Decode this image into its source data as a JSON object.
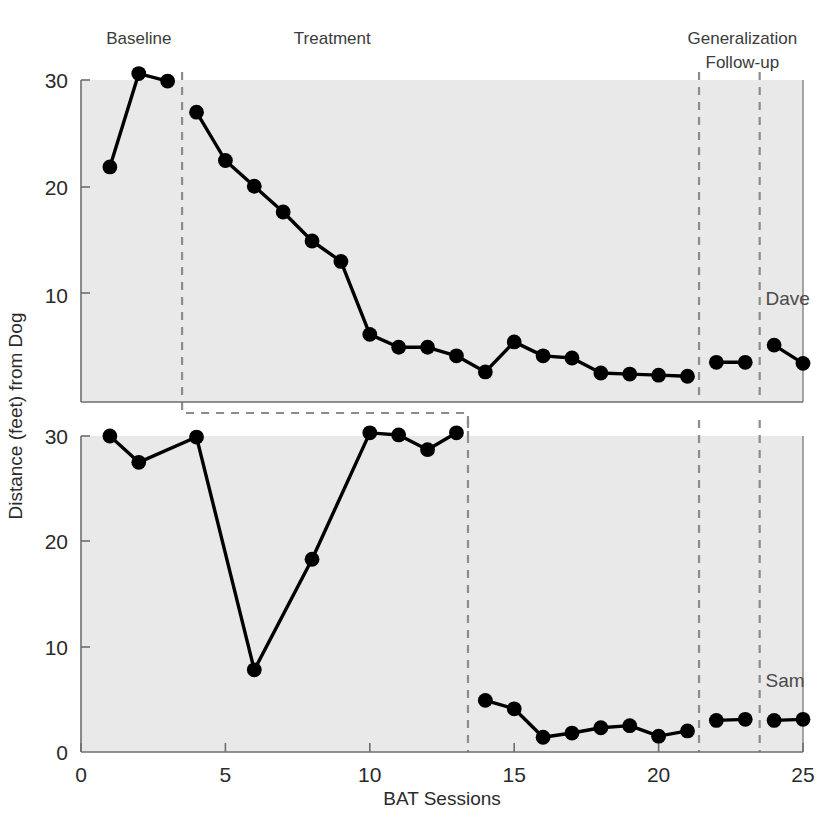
{
  "chart_data": {
    "type": "line",
    "title": "",
    "xlabel": "BAT Sessions",
    "ylabel": "Distance (feet) from Dog",
    "xlim": [
      0,
      25
    ],
    "ylim_top": [
      0,
      31
    ],
    "ylim_bottom": [
      0,
      31
    ],
    "grid": false,
    "legend": "none",
    "xticks": [
      0,
      5,
      10,
      15,
      20,
      25
    ],
    "yticks_top": [
      10,
      20,
      30
    ],
    "yticks_bottom": [
      0,
      10,
      20,
      30
    ],
    "phase_labels": [
      {
        "text": "Baseline",
        "x_session": 2.0,
        "panel": "top"
      },
      {
        "text": "Treatment",
        "x_session": 8.7,
        "panel": "top"
      },
      {
        "text": "Generalization",
        "x_session": 22.9,
        "panel": "top"
      },
      {
        "text": "Follow-up",
        "x_session": 22.9,
        "panel": "top"
      }
    ],
    "phase_dividers_top": [
      3.5,
      21.4,
      23.5
    ],
    "phase_dividers_bottom": [
      13.4,
      21.4,
      23.5
    ],
    "series": [
      {
        "name": "Dave",
        "panel": "top",
        "label_x_session": 23.7,
        "label_y_value": 9.0,
        "segments": [
          {
            "phase": "Baseline",
            "x": [
              1,
              2,
              3
            ],
            "y": [
              21.9,
              30.6,
              29.9
            ]
          },
          {
            "phase": "Treatment",
            "x": [
              4,
              5,
              6,
              7,
              8,
              9,
              10,
              11,
              12,
              13,
              14,
              15,
              16,
              17,
              18,
              19,
              20,
              21
            ],
            "y": [
              27.0,
              22.5,
              20.1,
              17.7,
              15.0,
              13.1,
              6.3,
              5.1,
              5.1,
              4.3,
              2.8,
              5.6,
              4.3,
              4.1,
              2.7,
              2.6,
              2.5,
              2.4
            ]
          },
          {
            "phase": "Generalization",
            "x": [
              22,
              23
            ],
            "y": [
              3.7,
              3.7
            ]
          },
          {
            "phase": "Follow-up",
            "x": [
              24,
              25
            ],
            "y": [
              5.3,
              3.6
            ]
          }
        ]
      },
      {
        "name": "Sam",
        "panel": "bottom",
        "label_x_session": 23.7,
        "label_y_value": 6.2,
        "segments": [
          {
            "phase": "Baseline",
            "x": [
              1,
              2,
              4,
              6,
              8,
              10,
              11,
              12,
              13
            ],
            "y": [
              30.0,
              27.5,
              29.9,
              7.8,
              18.3,
              30.3,
              30.1,
              28.7,
              30.3
            ]
          },
          {
            "phase": "Treatment",
            "x": [
              14,
              15,
              16,
              17,
              18,
              19,
              20,
              21
            ],
            "y": [
              4.9,
              4.1,
              1.4,
              1.8,
              2.3,
              2.5,
              1.5,
              2.0
            ]
          },
          {
            "phase": "Generalization",
            "x": [
              22,
              23
            ],
            "y": [
              3.0,
              3.1
            ]
          },
          {
            "phase": "Follow-up",
            "x": [
              24,
              25
            ],
            "y": [
              3.0,
              3.1
            ]
          }
        ]
      }
    ],
    "connector_box": {
      "x_start_session": 3.5,
      "x_end_session": 13.4,
      "note": "dashed rectangle linking top baseline divider down to bottom treatment onset"
    },
    "colors": {
      "plot_background": "#e9e9e9",
      "marker": "#000000",
      "line": "#000000",
      "divider": "#8c8c8c",
      "axis": "#6e6e6e",
      "text": "#2b2b2b"
    }
  }
}
